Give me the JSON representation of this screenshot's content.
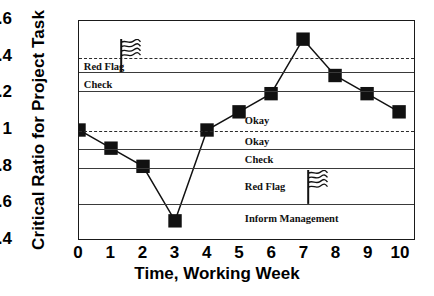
{
  "chart_data": {
    "type": "line",
    "title": "",
    "xlabel": "Time, Working Week",
    "ylabel": "Critical Ratio for Project Task",
    "x": [
      0,
      1,
      2,
      3,
      4,
      5,
      6,
      7,
      8,
      9,
      10
    ],
    "values": [
      1.0,
      0.9,
      0.8,
      0.5,
      1.0,
      1.1,
      1.2,
      1.5,
      1.3,
      1.2,
      1.1
    ],
    "series": [
      {
        "name": "Critical Ratio",
        "values": [
          1.0,
          0.9,
          0.8,
          0.5,
          1.0,
          1.1,
          1.2,
          1.5,
          1.3,
          1.2,
          1.1
        ]
      }
    ],
    "xlim": [
      0,
      10
    ],
    "ylim": [
      0.4,
      1.6
    ],
    "xticks": [
      "0",
      "1",
      "2",
      "3",
      "4",
      "5",
      "6",
      "7",
      "8",
      "9",
      "10"
    ],
    "yticks": [
      "1.6",
      "1.4",
      "1.2",
      "1",
      "0.8",
      "0.6",
      "0.4"
    ],
    "ytick_values": [
      1.6,
      1.4,
      1.2,
      1.0,
      0.8,
      0.6,
      0.4
    ],
    "grid": false,
    "legend": "none",
    "marker": "filled-square",
    "line_color": "#111111",
    "marker_color": "#111111",
    "reference_lines": [
      {
        "value": 1.4,
        "style": "dashed",
        "name": "upper-dashed-1-4"
      },
      {
        "value": 1.32,
        "style": "solid",
        "name": "red-flag-upper-bound"
      },
      {
        "value": 1.22,
        "style": "solid",
        "name": "check-upper-bound"
      },
      {
        "value": 1.0,
        "style": "dashed",
        "name": "mid-dashed-1-0"
      },
      {
        "value": 0.9,
        "style": "solid",
        "name": "okay-lower-bound"
      },
      {
        "value": 0.8,
        "style": "solid",
        "name": "check-lower-bound"
      },
      {
        "value": 0.6,
        "style": "solid",
        "name": "red-flag-lower-bound"
      }
    ],
    "zone_labels": [
      {
        "text": "Red Flag",
        "x": 0.15,
        "y": 1.355,
        "name": "zone-red-flag-upper"
      },
      {
        "text": "Check",
        "x": 0.15,
        "y": 1.255,
        "name": "zone-check-upper"
      },
      {
        "text": "Okay",
        "x": 5.15,
        "y": 1.06,
        "name": "zone-okay-upper"
      },
      {
        "text": "Okay",
        "x": 5.15,
        "y": 0.945,
        "name": "zone-okay-lower"
      },
      {
        "text": "Check",
        "x": 5.15,
        "y": 0.845,
        "name": "zone-check-lower"
      },
      {
        "text": "Red Flag",
        "x": 5.15,
        "y": 0.7,
        "name": "zone-red-flag-lower"
      },
      {
        "text": "Inform Management",
        "x": 5.15,
        "y": 0.525,
        "name": "zone-inform-management"
      }
    ],
    "flag_markers": [
      {
        "x": 1.25,
        "y_top": 1.5,
        "y_base": 1.32,
        "name": "flag-icon-upper"
      },
      {
        "x": 7.05,
        "y_top": 0.785,
        "y_base": 0.6,
        "name": "flag-icon-lower"
      }
    ]
  }
}
